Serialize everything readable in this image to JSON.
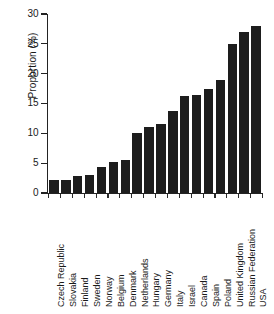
{
  "figure": {
    "title_sliver": "",
    "background": "#ffffff",
    "bar_color": "#1d1d1d",
    "axis_color": "#232323"
  },
  "chart_data": {
    "type": "bar",
    "title": "",
    "xlabel": "",
    "ylabel": "Proportion (%)",
    "ylim": [
      0,
      30
    ],
    "yticks": [
      0,
      5,
      10,
      15,
      20,
      25,
      30
    ],
    "ytick_labels": [
      "0",
      "5",
      "10",
      "15",
      "20",
      "25",
      "30"
    ],
    "grid": false,
    "legend": false,
    "categories": [
      "Czech Republic",
      "Slovakia",
      "Finland",
      "Sweden",
      "Norway",
      "Belgium",
      "Denmark",
      "Netherlands",
      "Hungary",
      "Germany",
      "Italy",
      "Israel",
      "Canada",
      "Spain",
      "Poland",
      "United Kingdom",
      "Russian Federation",
      "USA"
    ],
    "values": [
      2.2,
      2.2,
      2.9,
      3.0,
      4.3,
      5.2,
      5.5,
      10.1,
      11.0,
      11.5,
      13.8,
      16.2,
      16.5,
      17.5,
      19.0,
      24.9,
      27.0,
      28.0
    ]
  }
}
